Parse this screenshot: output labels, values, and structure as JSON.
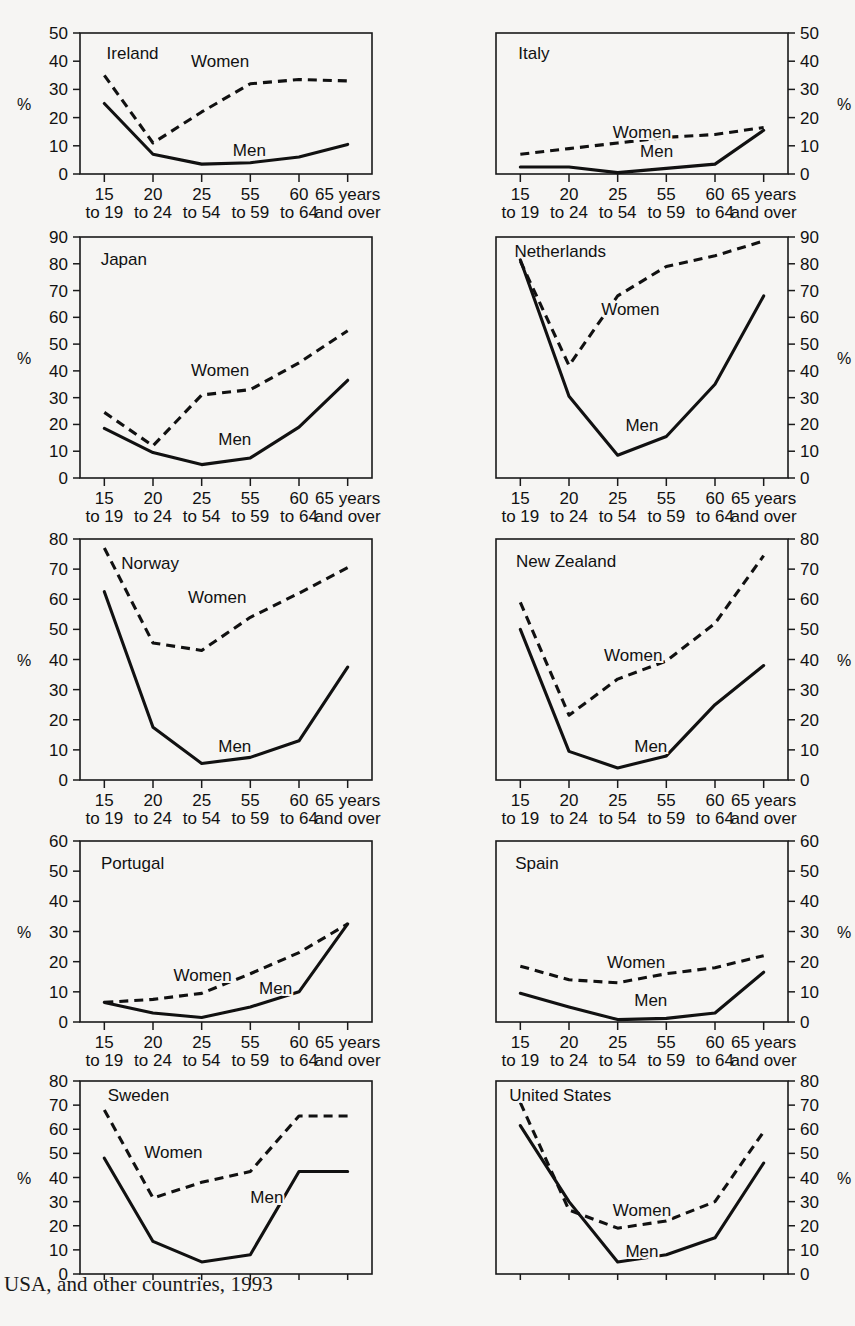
{
  "caption": "USA, and other countries, 1993",
  "cutoff_text": "",
  "axis": {
    "percent_symbol": "%",
    "categories": [
      {
        "top": "15",
        "bottom": "to 19"
      },
      {
        "top": "20",
        "bottom": "to 24"
      },
      {
        "top": "25",
        "bottom": "to 54"
      },
      {
        "top": "55",
        "bottom": "to 59"
      },
      {
        "top": "60",
        "bottom": "to 64"
      },
      {
        "top": "65 years",
        "bottom": "and over"
      }
    ]
  },
  "series_labels": {
    "women": "Women",
    "men": "Men"
  },
  "chart_data": [
    {
      "type": "line",
      "title": "Ireland",
      "ylabel": "%",
      "xlabel": "",
      "ylim": [
        0,
        50
      ],
      "yticks": [
        0,
        10,
        20,
        30,
        40,
        50
      ],
      "axis_side": "left",
      "grid": false,
      "categories": [
        "15 to 19",
        "20 to 24",
        "25 to 54",
        "55 to 59",
        "60 to 64",
        "65 years and over"
      ],
      "series": [
        {
          "name": "Women",
          "style": "dashed",
          "values": [
            35,
            11,
            22,
            32,
            33.5,
            33
          ]
        },
        {
          "name": "Men",
          "style": "solid",
          "values": [
            25,
            7,
            3.5,
            4,
            6,
            10.5
          ]
        }
      ],
      "annotations": [
        {
          "text": "Ireland",
          "x": 0.18,
          "y": 0.86
        },
        {
          "text": "Women",
          "x": 0.48,
          "y": 0.8
        },
        {
          "text": "Men",
          "x": 0.58,
          "y": 0.17
        }
      ]
    },
    {
      "type": "line",
      "title": "Italy",
      "ylabel": "%",
      "xlabel": "",
      "ylim": [
        0,
        50
      ],
      "yticks": [
        0,
        10,
        20,
        30,
        40,
        50
      ],
      "axis_side": "right",
      "grid": false,
      "categories": [
        "15 to 19",
        "20 to 24",
        "25 to 54",
        "55 to 59",
        "60 to 64",
        "65 years and over"
      ],
      "series": [
        {
          "name": "Women",
          "style": "dashed",
          "values": [
            7,
            9,
            11,
            13,
            14,
            16.5
          ]
        },
        {
          "name": "Men",
          "style": "solid",
          "values": [
            2.5,
            2.5,
            0.5,
            2,
            3.5,
            15.5
          ]
        }
      ],
      "annotations": [
        {
          "text": "Italy",
          "x": 0.13,
          "y": 0.86
        },
        {
          "text": "Women",
          "x": 0.5,
          "y": 0.3
        },
        {
          "text": "Men",
          "x": 0.55,
          "y": 0.16
        }
      ]
    },
    {
      "type": "line",
      "title": "Japan",
      "ylabel": "%",
      "xlabel": "",
      "ylim": [
        0,
        90
      ],
      "yticks": [
        0,
        10,
        20,
        30,
        40,
        50,
        60,
        70,
        80,
        90
      ],
      "axis_side": "left",
      "grid": false,
      "categories": [
        "15 to 19",
        "20 to 24",
        "25 to 54",
        "55 to 59",
        "60 to 64",
        "65 years and over"
      ],
      "series": [
        {
          "name": "Women",
          "style": "dashed",
          "values": [
            24.5,
            12,
            31,
            33,
            43,
            55
          ]
        },
        {
          "name": "Men",
          "style": "solid",
          "values": [
            18.5,
            9.5,
            5,
            7.5,
            19,
            36.5
          ]
        }
      ],
      "annotations": [
        {
          "text": "Japan",
          "x": 0.15,
          "y": 0.91
        },
        {
          "text": "Women",
          "x": 0.48,
          "y": 0.45
        },
        {
          "text": "Men",
          "x": 0.53,
          "y": 0.16
        }
      ]
    },
    {
      "type": "line",
      "title": "Netherlands",
      "ylabel": "%",
      "xlabel": "",
      "ylim": [
        0,
        90
      ],
      "yticks": [
        0,
        10,
        20,
        30,
        40,
        50,
        60,
        70,
        80,
        90
      ],
      "axis_side": "right",
      "grid": false,
      "categories": [
        "15 to 19",
        "20 to 24",
        "25 to 54",
        "55 to 59",
        "60 to 64",
        "65 years and over"
      ],
      "series": [
        {
          "name": "Women",
          "style": "dashed",
          "values": [
            81,
            42,
            68,
            79,
            83,
            88.5
          ]
        },
        {
          "name": "Men",
          "style": "solid",
          "values": [
            81.5,
            30.5,
            8.5,
            15.5,
            35,
            68
          ]
        }
      ],
      "annotations": [
        {
          "text": "Netherlands",
          "x": 0.22,
          "y": 0.94
        },
        {
          "text": "Women",
          "x": 0.46,
          "y": 0.7
        },
        {
          "text": "Men",
          "x": 0.5,
          "y": 0.22
        }
      ]
    },
    {
      "type": "line",
      "title": "Norway",
      "ylabel": "%",
      "xlabel": "",
      "ylim": [
        0,
        80
      ],
      "yticks": [
        0,
        10,
        20,
        30,
        40,
        50,
        60,
        70,
        80
      ],
      "axis_side": "left",
      "grid": false,
      "categories": [
        "15 to 19",
        "20 to 24",
        "25 to 54",
        "55 to 59",
        "60 to 64",
        "65 years and over"
      ],
      "series": [
        {
          "name": "Women",
          "style": "dashed",
          "values": [
            77,
            45.5,
            43,
            54,
            62,
            70.5
          ]
        },
        {
          "name": "Men",
          "style": "solid",
          "values": [
            62.5,
            17.5,
            5.5,
            7.5,
            13,
            37.5
          ]
        }
      ],
      "annotations": [
        {
          "text": "Norway",
          "x": 0.24,
          "y": 0.9
        },
        {
          "text": "Women",
          "x": 0.47,
          "y": 0.76
        },
        {
          "text": "Men",
          "x": 0.53,
          "y": 0.14
        }
      ]
    },
    {
      "type": "line",
      "title": "New Zealand",
      "ylabel": "%",
      "xlabel": "",
      "ylim": [
        0,
        80
      ],
      "yticks": [
        0,
        10,
        20,
        30,
        40,
        50,
        60,
        70,
        80
      ],
      "axis_side": "right",
      "grid": false,
      "categories": [
        "15 to 19",
        "20 to 24",
        "25 to 54",
        "55 to 59",
        "60 to 64",
        "65 years and over"
      ],
      "series": [
        {
          "name": "Women",
          "style": "dashed",
          "values": [
            59,
            21.5,
            33.5,
            39.5,
            52,
            74.5
          ]
        },
        {
          "name": "Men",
          "style": "solid",
          "values": [
            50,
            9.5,
            4,
            8,
            25,
            38
          ]
        }
      ],
      "annotations": [
        {
          "text": "New Zealand",
          "x": 0.24,
          "y": 0.91
        },
        {
          "text": "Women",
          "x": 0.47,
          "y": 0.52
        },
        {
          "text": "Men",
          "x": 0.53,
          "y": 0.14
        }
      ]
    },
    {
      "type": "line",
      "title": "Portugal",
      "ylabel": "%",
      "xlabel": "",
      "ylim": [
        0,
        60
      ],
      "yticks": [
        0,
        10,
        20,
        30,
        40,
        50,
        60
      ],
      "axis_side": "left",
      "grid": false,
      "categories": [
        "15 to 19",
        "20 to 24",
        "25 to 54",
        "55 to 59",
        "60 to 64",
        "65 years and over"
      ],
      "series": [
        {
          "name": "Women",
          "style": "dashed",
          "values": [
            6.5,
            7.5,
            9.5,
            16,
            23,
            32.5
          ]
        },
        {
          "name": "Men",
          "style": "solid",
          "values": [
            6.5,
            3,
            1.5,
            5,
            10,
            32.5
          ]
        }
      ],
      "annotations": [
        {
          "text": "Portugal",
          "x": 0.18,
          "y": 0.88
        },
        {
          "text": "Women",
          "x": 0.42,
          "y": 0.26
        },
        {
          "text": "Men",
          "x": 0.67,
          "y": 0.19
        }
      ]
    },
    {
      "type": "line",
      "title": "Spain",
      "ylabel": "%",
      "xlabel": "",
      "ylim": [
        0,
        60
      ],
      "yticks": [
        0,
        10,
        20,
        30,
        40,
        50,
        60
      ],
      "axis_side": "right",
      "grid": false,
      "categories": [
        "15 to 19",
        "20 to 24",
        "25 to 54",
        "55 to 59",
        "60 to 64",
        "65 years and over"
      ],
      "series": [
        {
          "name": "Women",
          "style": "dashed",
          "values": [
            18.5,
            14,
            13,
            16,
            18,
            22
          ]
        },
        {
          "name": "Men",
          "style": "solid",
          "values": [
            9.5,
            5,
            0.8,
            1.2,
            3,
            16.5
          ]
        }
      ],
      "annotations": [
        {
          "text": "Spain",
          "x": 0.14,
          "y": 0.88
        },
        {
          "text": "Women",
          "x": 0.48,
          "y": 0.33
        },
        {
          "text": "Men",
          "x": 0.53,
          "y": 0.12
        }
      ]
    },
    {
      "type": "line",
      "title": "Sweden",
      "ylabel": "%",
      "xlabel": "",
      "ylim": [
        0,
        80
      ],
      "yticks": [
        0,
        10,
        20,
        30,
        40,
        50,
        60,
        70,
        80
      ],
      "axis_side": "left",
      "grid": false,
      "categories": [
        "15 to 19",
        "20 to 24",
        "25 to 54",
        "55 to 59",
        "60 to 64",
        "65 years and over"
      ],
      "series": [
        {
          "name": "Women",
          "style": "dashed",
          "values": [
            68,
            31.5,
            38,
            42.5,
            65.5,
            65.5
          ]
        },
        {
          "name": "Men",
          "style": "solid",
          "values": [
            48,
            13.5,
            5,
            8,
            42.5,
            42.5
          ]
        }
      ],
      "annotations": [
        {
          "text": "Sweden",
          "x": 0.2,
          "y": 0.93
        },
        {
          "text": "Women",
          "x": 0.32,
          "y": 0.63
        },
        {
          "text": "Men",
          "x": 0.64,
          "y": 0.4
        }
      ]
    },
    {
      "type": "line",
      "title": "United States",
      "ylabel": "%",
      "xlabel": "",
      "ylim": [
        0,
        80
      ],
      "yticks": [
        0,
        10,
        20,
        30,
        40,
        50,
        60,
        70,
        80
      ],
      "axis_side": "right",
      "grid": false,
      "categories": [
        "15 to 19",
        "20 to 24",
        "25 to 54",
        "55 to 59",
        "60 to 64",
        "65 years and over"
      ],
      "series": [
        {
          "name": "Women",
          "style": "dashed",
          "values": [
            71,
            26.5,
            19,
            22,
            30,
            59
          ]
        },
        {
          "name": "Men",
          "style": "solid",
          "values": [
            61.5,
            30,
            5,
            8,
            15,
            46
          ]
        }
      ],
      "annotations": [
        {
          "text": "United States",
          "x": 0.22,
          "y": 0.93
        },
        {
          "text": "Women",
          "x": 0.5,
          "y": 0.33
        },
        {
          "text": "Men",
          "x": 0.5,
          "y": 0.12
        }
      ]
    }
  ],
  "panel_layout": [
    {
      "left": 14,
      "top": 24,
      "width": 410,
      "height": 196,
      "show_xlabels": true,
      "clip_bottom": false
    },
    {
      "left": 444,
      "top": 24,
      "width": 410,
      "height": 196,
      "show_xlabels": true,
      "clip_bottom": false
    },
    {
      "left": 14,
      "top": 228,
      "width": 410,
      "height": 296,
      "show_xlabels": true,
      "clip_bottom": false
    },
    {
      "left": 444,
      "top": 228,
      "width": 410,
      "height": 296,
      "show_xlabels": true,
      "clip_bottom": false
    },
    {
      "left": 14,
      "top": 530,
      "width": 410,
      "height": 296,
      "show_xlabels": true,
      "clip_bottom": false
    },
    {
      "left": 444,
      "top": 530,
      "width": 410,
      "height": 296,
      "show_xlabels": true,
      "clip_bottom": false
    },
    {
      "left": 14,
      "top": 832,
      "width": 410,
      "height": 236,
      "show_xlabels": true,
      "clip_bottom": false
    },
    {
      "left": 444,
      "top": 832,
      "width": 410,
      "height": 236,
      "show_xlabels": true,
      "clip_bottom": false
    },
    {
      "left": 14,
      "top": 1072,
      "width": 410,
      "height": 206,
      "show_xlabels": false,
      "clip_bottom": true
    },
    {
      "left": 444,
      "top": 1072,
      "width": 410,
      "height": 206,
      "show_xlabels": false,
      "clip_bottom": true
    }
  ]
}
